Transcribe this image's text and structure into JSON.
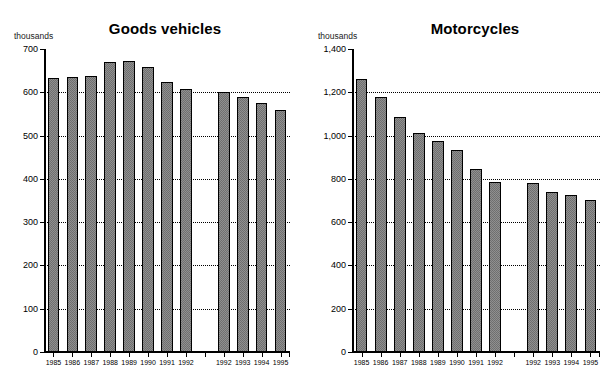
{
  "charts": [
    {
      "title": "Goods vehicles",
      "units_label": "thousands"
    },
    {
      "title": "Motorcycles",
      "units_label": "thousands"
    }
  ],
  "chart_data": [
    {
      "type": "bar",
      "title": "Goods vehicles",
      "xlabel": "",
      "ylabel": "thousands",
      "ylim": [
        0,
        700
      ],
      "yticks": [
        0,
        100,
        200,
        300,
        400,
        500,
        600,
        700
      ],
      "ytick_labels": [
        "0",
        "100",
        "200",
        "300",
        "400",
        "500",
        "600",
        "700"
      ],
      "grid": true,
      "legend": "none",
      "categories": [
        "1985",
        "1986",
        "1987",
        "1988",
        "1989",
        "1990",
        "1991",
        "1992",
        "1992",
        "1993",
        "1994",
        "1995"
      ],
      "values": [
        633,
        636,
        637,
        670,
        673,
        658,
        623,
        607,
        601,
        588,
        576,
        558
      ],
      "gap_after_index": 7
    },
    {
      "type": "bar",
      "title": "Motorcycles",
      "xlabel": "",
      "ylabel": "thousands",
      "ylim": [
        0,
        1400
      ],
      "yticks": [
        0,
        200,
        400,
        600,
        800,
        1000,
        1200,
        1400
      ],
      "ytick_labels": [
        "0",
        "200",
        "400",
        "600",
        "800",
        "1,000",
        "1,200",
        "1,400"
      ],
      "grid": true,
      "legend": "none",
      "categories": [
        "1985",
        "1986",
        "1987",
        "1988",
        "1989",
        "1990",
        "1991",
        "1992",
        "1992",
        "1993",
        "1994",
        "1995"
      ],
      "values": [
        1262,
        1178,
        1088,
        1013,
        975,
        932,
        845,
        785,
        782,
        740,
        727,
        704
      ],
      "gap_after_index": 7
    }
  ]
}
